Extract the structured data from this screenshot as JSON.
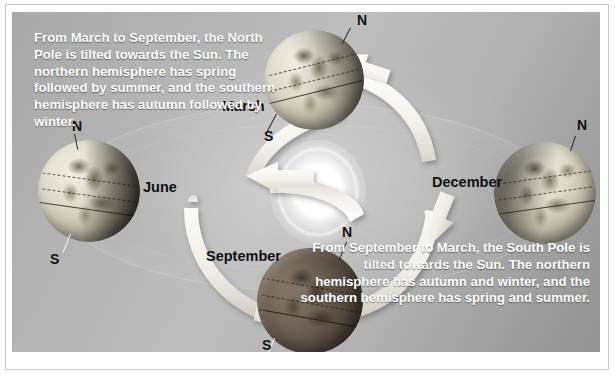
{
  "diagram": {
    "sun_label": "sun",
    "colors": {
      "panel_light": "#bdbdbd",
      "panel_dark": "#949494",
      "arrow": "#f2f1ec",
      "text_on_panel": "#ffffff",
      "label_text": "#111111"
    }
  },
  "captions": {
    "top_left": "From March to September, the North Pole is tilted towards the Sun. The northern hemisphere has spring followed by summer, and the southern hemisphere has autumn followed by winter.",
    "bottom_right": "From September to March, the South Pole is tilted towards the Sun. The northern hemisphere has autumn and winter, and the southern hemisphere has spring and summer."
  },
  "positions": [
    {
      "id": "march",
      "month_label": "March",
      "north_label": "N",
      "south_label": "S",
      "lit": true
    },
    {
      "id": "june",
      "month_label": "June",
      "north_label": "N",
      "south_label": "S",
      "lit": true
    },
    {
      "id": "september",
      "month_label": "September",
      "north_label": "N",
      "south_label": "S",
      "lit": false
    },
    {
      "id": "december",
      "month_label": "December",
      "north_label": "N",
      "south_label": "",
      "lit": true
    }
  ],
  "orbit_arrows": [
    {
      "id": "march-to-june",
      "from": "March",
      "to": "June"
    },
    {
      "id": "june-to-september",
      "from": "June",
      "to": "September"
    },
    {
      "id": "september-to-december",
      "from": "September",
      "to": "December"
    },
    {
      "id": "december-to-march",
      "from": "December",
      "to": "March"
    }
  ]
}
